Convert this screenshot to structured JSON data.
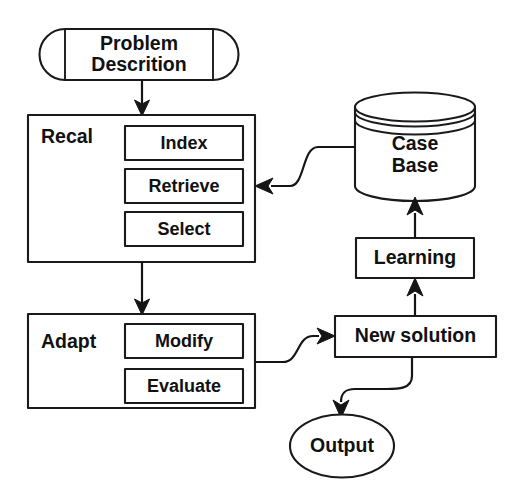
{
  "diagram": {
    "type": "flowchart",
    "canvas": {
      "width": 521,
      "height": 500
    },
    "colors": {
      "stroke": "#1a1a1a",
      "fill": "#ffffff",
      "text": "#111111",
      "background": "#ffffff"
    },
    "nodes": {
      "problem_description": {
        "label_line1": "Problem",
        "label_line2": "Descrition",
        "shape": "capsule-terminal"
      },
      "recall_group": {
        "label": "Recal",
        "shape": "rectangle",
        "children": {
          "index": {
            "label": "Index",
            "shape": "rectangle"
          },
          "retrieve": {
            "label": "Retrieve",
            "shape": "rectangle"
          },
          "select": {
            "label": "Select",
            "shape": "rectangle"
          }
        }
      },
      "adapt_group": {
        "label": "Adapt",
        "shape": "rectangle",
        "children": {
          "modify": {
            "label": "Modify",
            "shape": "rectangle"
          },
          "evaluate": {
            "label": "Evaluate",
            "shape": "rectangle"
          }
        }
      },
      "case_base": {
        "label_line1": "Case",
        "label_line2": "Base",
        "shape": "cylinder-database"
      },
      "learning": {
        "label": "Learning",
        "shape": "rectangle"
      },
      "new_solution": {
        "label": "New solution",
        "shape": "rectangle"
      },
      "output": {
        "label": "Output",
        "shape": "ellipse"
      }
    },
    "edges": [
      {
        "from": "problem_description",
        "to": "recall_group",
        "style": "straight-down"
      },
      {
        "from": "recall_group",
        "to": "adapt_group",
        "style": "straight-down"
      },
      {
        "from": "case_base",
        "to": "retrieve",
        "style": "s-curve-left"
      },
      {
        "from": "adapt_group",
        "to": "new_solution",
        "style": "s-curve-right"
      },
      {
        "from": "new_solution",
        "to": "learning",
        "style": "straight-up"
      },
      {
        "from": "learning",
        "to": "case_base",
        "style": "straight-up"
      },
      {
        "from": "new_solution",
        "to": "output",
        "style": "s-curve-down"
      }
    ]
  }
}
